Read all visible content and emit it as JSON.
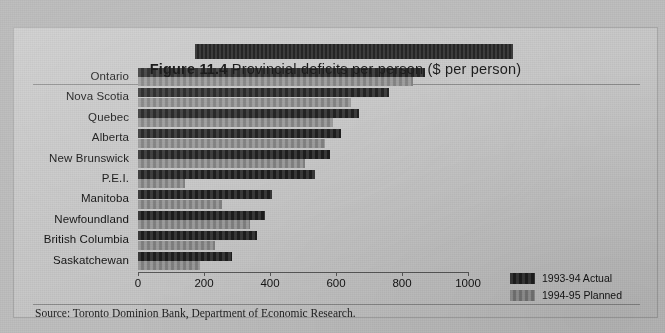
{
  "figure": {
    "title_prefix": "Figure 11.4",
    "title_rest": "Provincial deficits per person ($ per person)",
    "source": "Source:  Toronto Dominion Bank, Department of Economic Research."
  },
  "legend": {
    "items": [
      {
        "label": "1993-94 Actual",
        "color": "#232323",
        "key": "actual"
      },
      {
        "label": "1994-95 Planned",
        "color": "#8f8f8f",
        "key": "planned"
      }
    ]
  },
  "chart_data": {
    "type": "bar",
    "orientation": "horizontal",
    "title": "Figure 11.4 Provincial deficits per person ($ per person)",
    "xlabel": "",
    "ylabel": "",
    "xlim": [
      0,
      1000
    ],
    "xticks": [
      0,
      200,
      400,
      600,
      800,
      1000
    ],
    "xtick_labels": [
      "0",
      "200",
      "400",
      "600",
      "800",
      "1000"
    ],
    "grid": false,
    "legend_position": "bottom-right",
    "categories": [
      "Ontario",
      "Nova Scotia",
      "Quebec",
      "Alberta",
      "New Brunswick",
      "P.E.I.",
      "Manitoba",
      "Newfoundland",
      "British Columbia",
      "Saskatchewan"
    ],
    "series": [
      {
        "name": "1993-94 Actual",
        "color": "#232323",
        "values": [
          870,
          760,
          670,
          615,
          582,
          536,
          406,
          385,
          361,
          285
        ]
      },
      {
        "name": "1994-95 Planned",
        "color": "#8f8f8f",
        "values": [
          833,
          645,
          590,
          567,
          506,
          142,
          255,
          340,
          233,
          188
        ]
      }
    ]
  }
}
